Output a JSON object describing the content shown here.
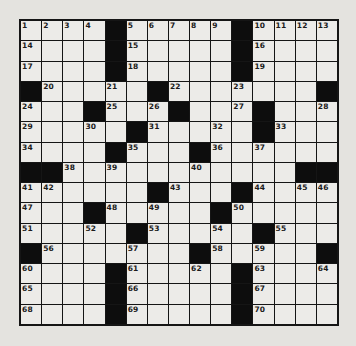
{
  "puzzle": {
    "type": "crossword",
    "rows": 15,
    "cols": 15,
    "colors": {
      "paper": "#e4e3df",
      "cell": "#ecebe8",
      "block": "#0d0d0d",
      "line": "#151515"
    },
    "layout": [
      "....#.....#....",
      "....#.....#....",
      "....#.....#....",
      "#.....#.......#",
      "...#...#...#...",
      ".....#.....#...",
      "....#...#......",
      "##...........##",
      "......#...#....",
      "...#.....#.....",
      ".....#.....#...",
      "#.......#.....#",
      "....#.....#....",
      "....#.....#....",
      "....#.....#...."
    ],
    "numbers": [
      [
        1,
        2,
        3,
        4,
        0,
        5,
        6,
        7,
        8,
        9,
        0,
        10,
        11,
        12,
        13
      ],
      [
        14,
        0,
        0,
        0,
        0,
        15,
        0,
        0,
        0,
        0,
        0,
        16,
        0,
        0,
        0
      ],
      [
        17,
        0,
        0,
        0,
        0,
        18,
        0,
        0,
        0,
        0,
        0,
        19,
        0,
        0,
        0
      ],
      [
        0,
        20,
        0,
        0,
        21,
        0,
        0,
        22,
        0,
        0,
        23,
        0,
        0,
        0,
        0
      ],
      [
        24,
        0,
        0,
        0,
        25,
        0,
        26,
        0,
        0,
        0,
        27,
        0,
        0,
        0,
        28
      ],
      [
        29,
        0,
        0,
        30,
        0,
        0,
        31,
        0,
        0,
        32,
        0,
        0,
        33,
        0,
        0
      ],
      [
        34,
        0,
        0,
        0,
        0,
        35,
        0,
        0,
        0,
        36,
        0,
        37,
        0,
        0,
        0
      ],
      [
        0,
        0,
        38,
        0,
        39,
        0,
        0,
        0,
        40,
        0,
        0,
        0,
        0,
        0,
        0
      ],
      [
        41,
        42,
        0,
        0,
        0,
        0,
        0,
        43,
        0,
        0,
        0,
        44,
        0,
        45,
        46
      ],
      [
        47,
        0,
        0,
        0,
        48,
        0,
        49,
        0,
        0,
        0,
        50,
        0,
        0,
        0,
        0
      ],
      [
        51,
        0,
        0,
        52,
        0,
        0,
        53,
        0,
        0,
        54,
        0,
        0,
        55,
        0,
        0
      ],
      [
        0,
        56,
        0,
        0,
        0,
        57,
        0,
        0,
        0,
        58,
        0,
        59,
        0,
        0,
        0
      ],
      [
        60,
        0,
        0,
        0,
        0,
        61,
        0,
        0,
        62,
        0,
        0,
        63,
        0,
        0,
        64
      ],
      [
        65,
        0,
        0,
        0,
        0,
        66,
        0,
        0,
        0,
        0,
        0,
        67,
        0,
        0,
        0
      ],
      [
        68,
        0,
        0,
        0,
        0,
        69,
        0,
        0,
        0,
        0,
        0,
        70,
        0,
        0,
        0
      ]
    ],
    "entries": {}
  }
}
